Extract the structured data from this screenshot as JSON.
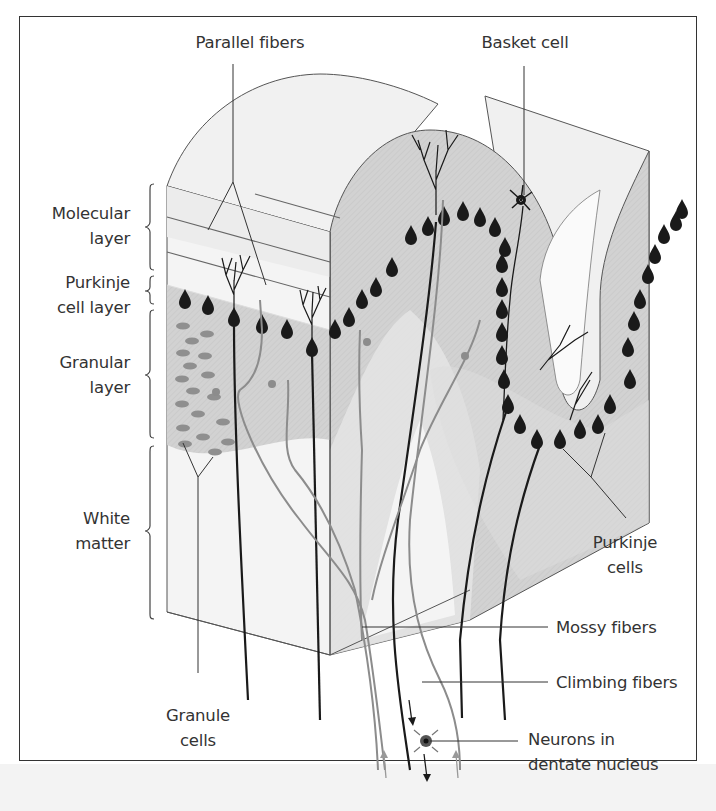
{
  "figure": {
    "colors": {
      "frame": "#333333",
      "tissue_light": "#ebebeb",
      "gray_matter": "#d6d6d6",
      "granular": "#cfcfcf",
      "purkinje_cell": "#1a1a1a",
      "fiber_gray": "#8c8c8c",
      "fiber_black": "#1a1a1a",
      "white_matter": "#f4f4f4"
    }
  },
  "labels": {
    "parallel_fibers": "Parallel fibers",
    "basket_cell": "Basket cell",
    "molecular_layer": [
      "Molecular",
      "layer"
    ],
    "purkinje_cell_layer": [
      "Purkinje",
      "cell layer"
    ],
    "granular_layer": [
      "Granular",
      "layer"
    ],
    "white_matter": [
      "White",
      "matter"
    ],
    "purkinje_cells": [
      "Purkinje",
      "cells"
    ],
    "mossy_fibers": "Mossy fibers",
    "climbing_fibers": "Climbing fibers",
    "granule_cells": [
      "Granule",
      "cells"
    ],
    "neurons_dentate": [
      "Neurons in",
      "dentate nucleus"
    ]
  }
}
